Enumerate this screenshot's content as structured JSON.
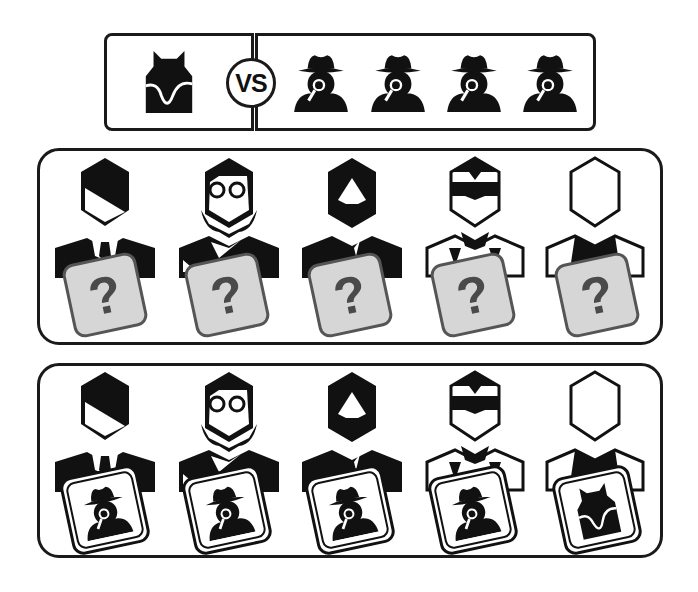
{
  "title_bar": {
    "left_player": {
      "role": "werewolf",
      "icon": "werewolf-icon"
    },
    "versus_label": "VS",
    "right_players": [
      {
        "role": "detective",
        "icon": "detective-icon"
      },
      {
        "role": "detective",
        "icon": "detective-icon"
      },
      {
        "role": "detective",
        "icon": "detective-icon"
      },
      {
        "role": "detective",
        "icon": "detective-icon"
      }
    ]
  },
  "panel_hidden": {
    "description": "Roles hidden",
    "players": [
      {
        "avatar": "side-part-hair",
        "card_label": "?"
      },
      {
        "avatar": "glasses-long-hair",
        "card_label": "?"
      },
      {
        "avatar": "bearded",
        "card_label": "?"
      },
      {
        "avatar": "sunglasses",
        "card_label": "?"
      },
      {
        "avatar": "blank-face",
        "card_label": "?"
      }
    ]
  },
  "panel_revealed": {
    "description": "Roles revealed",
    "players": [
      {
        "avatar": "side-part-hair",
        "role": "detective"
      },
      {
        "avatar": "glasses-long-hair",
        "role": "detective"
      },
      {
        "avatar": "bearded",
        "role": "detective"
      },
      {
        "avatar": "sunglasses",
        "role": "detective"
      },
      {
        "avatar": "blank-face",
        "role": "werewolf"
      }
    ]
  },
  "colors": {
    "ink": "#111111",
    "card_fill": "#d6d6d6",
    "card_border": "#555555",
    "question_mark": "#4a4a4a",
    "background": "#ffffff"
  }
}
